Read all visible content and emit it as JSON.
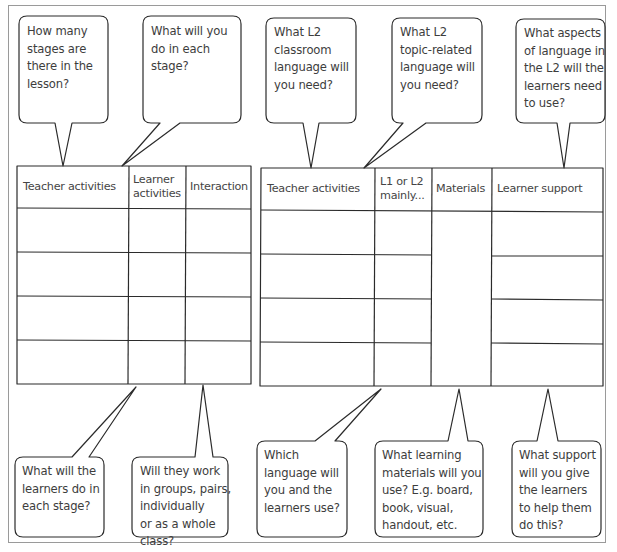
{
  "colors": {
    "line": "#2b2b2b",
    "text": "#3d3d3d",
    "frame": "#9a9a9a",
    "background": "#ffffff"
  },
  "top_bubbles": [
    {
      "id": "stages",
      "text": "How many\nstages are\nthere in the\nlesson?"
    },
    {
      "id": "each_stage",
      "text": "What will you\ndo in each\nstage?"
    },
    {
      "id": "classroom_language",
      "text": "What L2\nclassroom\nlanguage will\nyou need?"
    },
    {
      "id": "topic_language",
      "text": "What L2\ntopic-related\nlanguage will\nyou need?"
    },
    {
      "id": "language_aspects",
      "text": "What aspects\nof language in\nthe L2 will the\nlearners need\nto use?"
    }
  ],
  "bottom_bubbles": [
    {
      "id": "learners_do",
      "text": "What will the\nlearners do in\neach stage?"
    },
    {
      "id": "interaction",
      "text": "Will they work\nin groups, pairs,\nindividually\nor as a whole\nclass?"
    },
    {
      "id": "which_language",
      "text": "Which\nlanguage will\nyou and the\nlearners use?"
    },
    {
      "id": "materials",
      "text": "What learning\nmaterials will you\nuse? E.g. board,\nbook, visual,\nhandout, etc."
    },
    {
      "id": "support",
      "text": "What support\nwill you give\nthe learners\nto help them\ndo this?"
    }
  ],
  "left_table": {
    "headers": [
      "Teacher activities",
      "Learner\nactivities",
      "Interaction"
    ],
    "rows": [
      [
        "",
        "",
        ""
      ],
      [
        "",
        "",
        ""
      ],
      [
        "",
        "",
        ""
      ],
      [
        "",
        "",
        ""
      ]
    ]
  },
  "right_table": {
    "headers": [
      "Teacher activities",
      "L1 or L2\nmainly...",
      "Materials",
      "Learner support"
    ],
    "rows": [
      [
        "",
        "",
        "",
        ""
      ],
      [
        "",
        "",
        "",
        ""
      ],
      [
        "",
        "",
        "",
        ""
      ],
      [
        "",
        "",
        "",
        ""
      ]
    ]
  }
}
